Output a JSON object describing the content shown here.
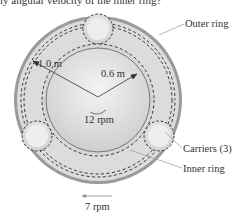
{
  "caption": "ly angular velocity of the inner ring?",
  "labels": {
    "outer_ring": "Outer ring",
    "carriers": "Carriers (3)",
    "inner_ring": "Inner ring",
    "outer_radius": "1.0 m",
    "inner_radius": "0.6 m",
    "inner_speed": "12 rpm",
    "outer_speed": "7 rpm"
  },
  "colors": {
    "gear_fill": "#d9d9d9",
    "rim": "#888888",
    "line": "#333333"
  }
}
